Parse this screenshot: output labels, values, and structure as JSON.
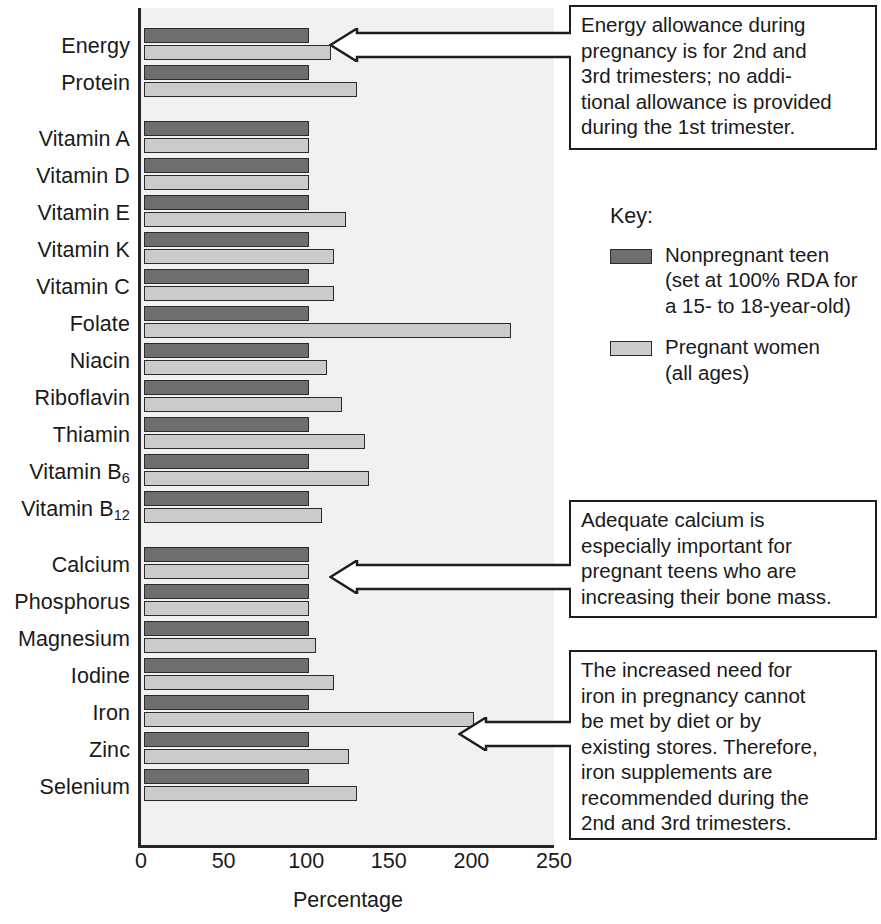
{
  "chart_data": {
    "type": "bar",
    "title": "",
    "xlabel": "Percentage",
    "ylabel": "",
    "xlim": [
      0,
      250
    ],
    "xticks": [
      0,
      50,
      100,
      150,
      200,
      250
    ],
    "grid": false,
    "orientation": "horizontal",
    "legend_position": "right",
    "categories": [
      "Energy",
      "Protein",
      "Vitamin A",
      "Vitamin D",
      "Vitamin E",
      "Vitamin K",
      "Vitamin C",
      "Folate",
      "Niacin",
      "Riboflavin",
      "Thiamin",
      "Vitamin B6",
      "Vitamin B12",
      "Calcium",
      "Phosphorus",
      "Magnesium",
      "Iodine",
      "Iron",
      "Zinc",
      "Selenium"
    ],
    "category_labels_html": [
      "Energy",
      "Protein",
      "Vitamin A",
      "Vitamin D",
      "Vitamin E",
      "Vitamin K",
      "Vitamin C",
      "Folate",
      "Niacin",
      "Riboflavin",
      "Thiamin",
      "Vitamin B<sub>6</sub>",
      "Vitamin B<sub>12</sub>",
      "Calcium",
      "Phosphorus",
      "Magnesium",
      "Iodine",
      "Iron",
      "Zinc",
      "Selenium"
    ],
    "series": [
      {
        "name": "Nonpregnant teen",
        "color": "#6e6e6e",
        "values": [
          100,
          100,
          100,
          100,
          100,
          100,
          100,
          100,
          100,
          100,
          100,
          100,
          100,
          100,
          100,
          100,
          100,
          100,
          100,
          100
        ]
      },
      {
        "name": "Pregnant women",
        "color": "#cbcbcb",
        "values": [
          113,
          129,
          100,
          100,
          122,
          115,
          115,
          222,
          111,
          120,
          134,
          136,
          108,
          100,
          100,
          104,
          115,
          200,
          124,
          129
        ]
      }
    ]
  },
  "axis": {
    "xticks": [
      "0",
      "50",
      "100",
      "150",
      "200",
      "250"
    ],
    "xlabel": "Percentage"
  },
  "legend": {
    "title": "Key:",
    "items": [
      {
        "swatch": "dark",
        "text": "Nonpregnant teen\n(set at 100% RDA for\na 15- to 18-year-old)"
      },
      {
        "swatch": "light",
        "text": "Pregnant women\n(all ages)"
      }
    ]
  },
  "callouts": [
    {
      "id": "energy-callout",
      "text": "Energy allowance during\npregnancy is for 2nd and\n3rd trimesters; no addi-\ntional allowance is provided\nduring the 1st trimester."
    },
    {
      "id": "calcium-callout",
      "text": "Adequate calcium is\nespecially important for\npregnant teens who are\nincreasing their bone mass."
    },
    {
      "id": "iron-callout",
      "text": "The increased need for\niron in pregnancy cannot\nbe met by diet or by\nexisting stores. Therefore,\niron supplements are\nrecommended during the\n2nd and 3rd trimesters."
    }
  ],
  "colors": {
    "dark_bar": "#6e6e6e",
    "light_bar": "#cbcbcb",
    "plot_background": "#f1f1f1",
    "axis": "#262626"
  }
}
